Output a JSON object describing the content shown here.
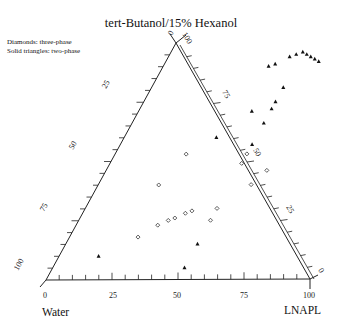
{
  "title": "tert-Butanol/15% Hexanol",
  "legend": [
    "Diamonds: three-phase",
    "Solid triangles: two-phase"
  ],
  "vertices": {
    "bottom_left": "Water",
    "bottom_right": "LNAPL",
    "top": "tert-Butanol/15% Hexanol"
  },
  "chart_data": {
    "type": "scatter",
    "subtype": "ternary",
    "title": "tert-Butanol/15% Hexanol",
    "axes": {
      "bottom": {
        "label": "LNAPL",
        "ticks": [
          "0",
          "25",
          "50",
          "75",
          "100"
        ],
        "from": "Water",
        "to": "LNAPL"
      },
      "left": {
        "ticks": [
          "100",
          "75",
          "50",
          "25",
          "0"
        ]
      },
      "right": {
        "ticks": [
          "0",
          "25",
          "50",
          "75",
          "100"
        ]
      }
    },
    "legend_position": "top-left",
    "series": [
      {
        "name": "three-phase",
        "marker": "diamond-open",
        "points_lnapl_alcohol": [
          [
            27,
            53
          ],
          [
            50,
            53
          ],
          [
            50,
            49
          ],
          [
            61,
            46
          ],
          [
            58,
            40
          ],
          [
            23,
            40
          ],
          [
            41,
            29
          ],
          [
            39,
            28
          ],
          [
            36,
            26
          ],
          [
            34,
            25
          ],
          [
            31,
            23
          ],
          [
            26,
            18
          ],
          [
            50,
            30
          ],
          [
            50,
            25
          ]
        ]
      },
      {
        "name": "two-phase",
        "marker": "triangle-filled",
        "points_lnapl_alcohol": [
          [
            50,
            81
          ],
          [
            50,
            75
          ],
          [
            50,
            72
          ],
          [
            50,
            66
          ],
          [
            50,
            57
          ],
          [
            43,
            71
          ],
          [
            35,
            60
          ],
          [
            50,
            15
          ],
          [
            50,
            5
          ],
          [
            15,
            10
          ],
          [
            46,
            94
          ],
          [
            48,
            95
          ],
          [
            50,
            96
          ],
          [
            52,
            95
          ],
          [
            54,
            94
          ],
          [
            56,
            93
          ],
          [
            58,
            92
          ],
          [
            42,
            91
          ],
          [
            40,
            90
          ]
        ]
      }
    ]
  }
}
